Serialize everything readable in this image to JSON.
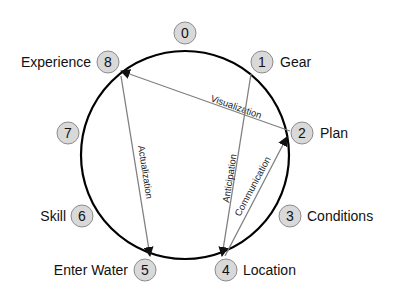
{
  "diagram": {
    "colors": {
      "circle": "#000000",
      "arrow": "#808080",
      "badge_fill": "#d9d9d9",
      "badge_stroke": "#8c8c8c",
      "text": "#111111"
    },
    "nodes": [
      {
        "id": "0",
        "number": "0",
        "label": ""
      },
      {
        "id": "1",
        "number": "1",
        "label": "Gear"
      },
      {
        "id": "2",
        "number": "2",
        "label": "Plan"
      },
      {
        "id": "3",
        "number": "3",
        "label": "Conditions"
      },
      {
        "id": "4",
        "number": "4",
        "label": "Location"
      },
      {
        "id": "5",
        "number": "5",
        "label": "Enter Water"
      },
      {
        "id": "6",
        "number": "6",
        "label": "Skill"
      },
      {
        "id": "7",
        "number": "7",
        "label": ""
      },
      {
        "id": "8",
        "number": "8",
        "label": "Experience"
      }
    ],
    "edges": [
      {
        "from": "2",
        "to": "8",
        "label": "Visualization"
      },
      {
        "from": "8",
        "to": "5",
        "label": "Actualization"
      },
      {
        "from": "1",
        "to": "4",
        "label": "Anticipation"
      },
      {
        "from": "4",
        "to": "2",
        "label": "Communication"
      }
    ]
  }
}
